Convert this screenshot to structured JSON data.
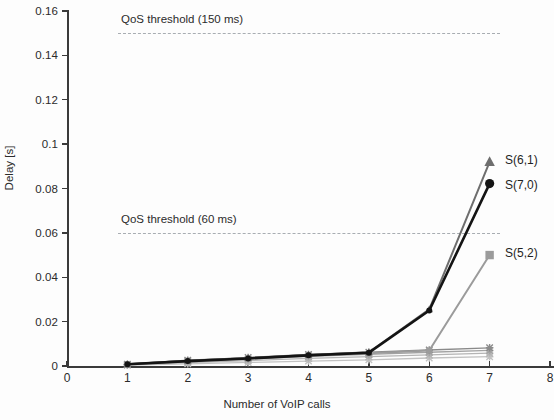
{
  "chart_data": {
    "type": "line",
    "title": "",
    "xlabel": "Number of VoIP calls",
    "ylabel": "Delay [s]",
    "xlim": [
      0,
      8
    ],
    "ylim": [
      0,
      0.16
    ],
    "grid": false,
    "legend_position": "right-of-line-ends",
    "x": [
      1,
      2,
      3,
      4,
      5,
      6,
      7
    ],
    "xticks": [
      "0",
      "1",
      "2",
      "3",
      "4",
      "5",
      "6",
      "7",
      "8"
    ],
    "yticks": [
      "0",
      "0.02",
      "0.04",
      "0.06",
      "0.08",
      "0.1",
      "0.12",
      "0.14",
      "0.16"
    ],
    "series": [
      {
        "name": "S(7,0)",
        "marker": "circle",
        "color": "#141414",
        "values": [
          0.0008,
          0.0022,
          0.0034,
          0.0048,
          0.006,
          0.025,
          0.0822
        ]
      },
      {
        "name": "S(6,1)",
        "marker": "triangle",
        "color": "#6e6e6e",
        "values": [
          0.0008,
          0.0024,
          0.0036,
          0.005,
          0.0062,
          0.0255,
          0.092
        ]
      },
      {
        "name": "S(5,2)",
        "marker": "square",
        "color": "#9b9b9b",
        "values": [
          0.0008,
          0.0024,
          0.0035,
          0.005,
          0.0058,
          0.007,
          0.05
        ]
      },
      {
        "name": "low-series-1",
        "marker": "cross",
        "color": "#8a8a8a",
        "values": [
          0.0008,
          0.0026,
          0.0038,
          0.0052,
          0.0062,
          0.0072,
          0.0082
        ]
      },
      {
        "name": "low-series-2",
        "marker": "cross",
        "color": "#a3a3a3",
        "values": [
          0.0006,
          0.002,
          0.0031,
          0.0043,
          0.0052,
          0.0062,
          0.007
        ]
      },
      {
        "name": "low-series-3",
        "marker": "cross",
        "color": "#b4b4b4",
        "values": [
          0.0005,
          0.0015,
          0.0024,
          0.0034,
          0.0042,
          0.005,
          0.0058
        ]
      },
      {
        "name": "low-series-4",
        "marker": "cross",
        "color": "#c2c2c2",
        "values": [
          0.0004,
          0.001,
          0.0016,
          0.0022,
          0.0028,
          0.0036,
          0.0042
        ]
      }
    ],
    "thresholds": [
      {
        "label": "QoS threshold (150 ms)",
        "value": 0.15,
        "color": "#9aa0a6"
      },
      {
        "label": "QoS threshold (60 ms)",
        "value": 0.06,
        "color": "#9aa0a6"
      }
    ],
    "end_labels": [
      {
        "text": "S(6,1)"
      },
      {
        "text": "S(7,0)"
      },
      {
        "text": "S(5,2)"
      }
    ]
  }
}
